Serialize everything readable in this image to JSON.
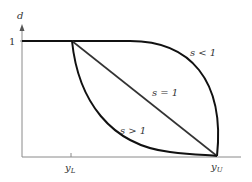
{
  "diagram": {
    "y_axis_label": "d",
    "y_tick_label": "1",
    "x_tick_lower": {
      "base": "y",
      "sub": "L"
    },
    "x_tick_upper": {
      "base": "y",
      "sub": "U"
    },
    "curves": [
      {
        "id": "s-less-1",
        "label": "s < 1",
        "shape": "concave, bows above the diagonal"
      },
      {
        "id": "s-equal-1",
        "label": "s = 1",
        "shape": "straight line from (yL,1) to (yU,0)"
      },
      {
        "id": "s-greater-1",
        "label": "s > 1",
        "shape": "convex, bows below the diagonal"
      }
    ],
    "colors": {
      "curve": "#111111",
      "axis": "#8a8a8a",
      "text": "#333333"
    }
  }
}
